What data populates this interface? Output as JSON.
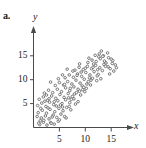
{
  "figure": {
    "part_label": "a.",
    "x_axis_name": "x",
    "y_axis_name": "y"
  },
  "chart_data": {
    "type": "scatter",
    "title": "",
    "subtitle": "",
    "xlabel": "x",
    "ylabel": "y",
    "xlim": [
      0,
      18.5
    ],
    "ylim": [
      0,
      19
    ],
    "grid": false,
    "legend": null,
    "annotations": [
      "a."
    ],
    "xticks": [
      5,
      10,
      15
    ],
    "yticks": [
      5,
      10,
      15
    ],
    "xtick_labels": [
      "5",
      "10",
      "15"
    ],
    "ytick_labels": [
      "5",
      "10",
      "15"
    ],
    "marker": {
      "shape": "circle",
      "filled": false,
      "size_px": 2.6,
      "edge_color": "#6b6b6b",
      "face_color": "#ffffff"
    },
    "axis_color": "#4a4a4a",
    "points": [
      [
        1.2,
        0.6
      ],
      [
        1.9,
        1.1
      ],
      [
        2.6,
        0.5
      ],
      [
        3.3,
        1.0
      ],
      [
        4.0,
        0.7
      ],
      [
        4.8,
        1.3
      ],
      [
        1.5,
        2.0
      ],
      [
        2.3,
        2.4
      ],
      [
        3.0,
        1.8
      ],
      [
        3.8,
        2.6
      ],
      [
        4.5,
        2.1
      ],
      [
        5.3,
        2.8
      ],
      [
        6.0,
        2.3
      ],
      [
        0.9,
        3.1
      ],
      [
        1.7,
        3.6
      ],
      [
        2.5,
        3.0
      ],
      [
        3.2,
        3.8
      ],
      [
        4.1,
        3.3
      ],
      [
        4.9,
        4.0
      ],
      [
        5.7,
        3.5
      ],
      [
        6.4,
        4.2
      ],
      [
        7.2,
        3.7
      ],
      [
        0.8,
        4.6
      ],
      [
        1.6,
        5.1
      ],
      [
        2.4,
        4.4
      ],
      [
        3.1,
        5.3
      ],
      [
        3.9,
        4.8
      ],
      [
        4.7,
        5.6
      ],
      [
        5.5,
        5.0
      ],
      [
        6.2,
        5.8
      ],
      [
        7.0,
        5.2
      ],
      [
        7.8,
        6.0
      ],
      [
        8.6,
        5.4
      ],
      [
        1.1,
        5.9
      ],
      [
        1.9,
        6.4
      ],
      [
        2.7,
        5.7
      ],
      [
        3.5,
        6.6
      ],
      [
        4.3,
        6.1
      ],
      [
        5.1,
        6.9
      ],
      [
        5.9,
        6.3
      ],
      [
        6.7,
        7.1
      ],
      [
        7.5,
        6.5
      ],
      [
        8.3,
        7.3
      ],
      [
        9.1,
        6.8
      ],
      [
        9.9,
        7.5
      ],
      [
        2.1,
        7.2
      ],
      [
        2.9,
        7.8
      ],
      [
        3.7,
        7.3
      ],
      [
        4.6,
        8.0
      ],
      [
        5.4,
        7.5
      ],
      [
        6.2,
        8.3
      ],
      [
        7.0,
        7.7
      ],
      [
        7.8,
        8.5
      ],
      [
        8.6,
        8.0
      ],
      [
        9.4,
        8.7
      ],
      [
        10.2,
        8.2
      ],
      [
        11.0,
        8.9
      ],
      [
        4.2,
        8.8
      ],
      [
        5.0,
        9.4
      ],
      [
        5.8,
        8.9
      ],
      [
        6.6,
        9.6
      ],
      [
        7.4,
        9.1
      ],
      [
        8.2,
        9.9
      ],
      [
        9.0,
        9.3
      ],
      [
        9.8,
        10.1
      ],
      [
        10.6,
        9.6
      ],
      [
        11.4,
        10.3
      ],
      [
        12.2,
        9.8
      ],
      [
        6.1,
        10.4
      ],
      [
        6.9,
        11.0
      ],
      [
        7.7,
        10.5
      ],
      [
        8.5,
        11.2
      ],
      [
        9.3,
        10.7
      ],
      [
        10.1,
        11.5
      ],
      [
        10.9,
        11.0
      ],
      [
        11.7,
        11.7
      ],
      [
        12.5,
        11.1
      ],
      [
        13.3,
        11.9
      ],
      [
        8.0,
        12.0
      ],
      [
        8.8,
        12.6
      ],
      [
        9.6,
        12.1
      ],
      [
        10.4,
        12.8
      ],
      [
        11.2,
        12.3
      ],
      [
        12.0,
        13.0
      ],
      [
        12.8,
        12.5
      ],
      [
        13.6,
        13.2
      ],
      [
        14.4,
        12.7
      ],
      [
        15.2,
        13.4
      ],
      [
        10.5,
        13.6
      ],
      [
        11.3,
        14.1
      ],
      [
        12.1,
        13.8
      ],
      [
        12.9,
        14.4
      ],
      [
        13.7,
        13.9
      ],
      [
        14.5,
        14.6
      ],
      [
        15.3,
        14.0
      ],
      [
        11.9,
        15.1
      ],
      [
        12.7,
        15.4
      ],
      [
        13.5,
        15.0
      ],
      [
        14.3,
        15.6
      ],
      [
        13.1,
        16.0
      ],
      [
        2.0,
        1.5
      ],
      [
        3.6,
        2.2
      ],
      [
        5.0,
        1.6
      ],
      [
        6.3,
        2.0
      ],
      [
        2.8,
        4.1
      ],
      [
        4.4,
        4.5
      ],
      [
        6.9,
        4.4
      ],
      [
        8.1,
        4.9
      ],
      [
        1.3,
        1.4
      ],
      [
        3.4,
        0.9
      ],
      [
        5.6,
        4.3
      ],
      [
        7.3,
        5.9
      ],
      [
        9.5,
        7.9
      ],
      [
        10.8,
        10.4
      ],
      [
        12.4,
        12.1
      ],
      [
        14.0,
        13.5
      ],
      [
        15.0,
        14.3
      ],
      [
        15.8,
        13.1
      ],
      [
        14.8,
        12.3
      ],
      [
        13.9,
        12.8
      ],
      [
        11.6,
        13.3
      ],
      [
        10.0,
        12.4
      ],
      [
        9.2,
        11.6
      ],
      [
        8.4,
        10.9
      ],
      [
        7.6,
        11.8
      ],
      [
        6.5,
        12.2
      ],
      [
        16.0,
        12.5
      ],
      [
        15.5,
        11.8
      ],
      [
        14.7,
        11.2
      ],
      [
        13.0,
        10.2
      ],
      [
        12.3,
        10.8
      ],
      [
        11.1,
        9.9
      ],
      [
        10.3,
        9.1
      ],
      [
        9.7,
        8.4
      ],
      [
        8.9,
        7.6
      ],
      [
        7.9,
        7.0
      ],
      [
        6.8,
        6.2
      ],
      [
        5.2,
        4.7
      ],
      [
        4.0,
        5.4
      ],
      [
        3.0,
        6.0
      ],
      [
        2.2,
        5.5
      ],
      [
        1.4,
        4.0
      ],
      [
        0.7,
        2.3
      ],
      [
        1.0,
        0.9
      ],
      [
        2.5,
        6.8
      ],
      [
        3.3,
        9.5
      ],
      [
        4.8,
        10.2
      ],
      [
        5.6,
        11.0
      ],
      [
        6.0,
        9.0
      ],
      [
        7.1,
        8.2
      ],
      [
        8.9,
        13.3
      ],
      [
        10.7,
        14.5
      ],
      [
        11.5,
        12.6
      ],
      [
        12.6,
        14.8
      ],
      [
        13.4,
        14.9
      ]
    ]
  }
}
